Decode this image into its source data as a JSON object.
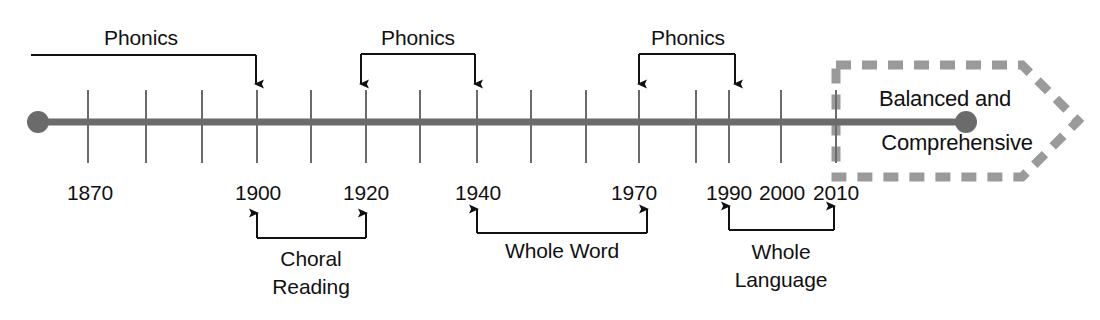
{
  "diagram": {
    "colors": {
      "axis": "#6b6b6b",
      "tick": "#6b6b6b",
      "ink": "#111111",
      "banner_dash": "#9a9a9a",
      "background": "#ffffff"
    },
    "axis": {
      "start_x": 36,
      "end_x": 967,
      "y": 122,
      "start_dot": true,
      "end_dot": true
    }
  },
  "chart_data": {
    "type": "timeline",
    "xlabel": "",
    "ylabel": "",
    "tick_years": [
      "1870",
      "1880",
      "1890",
      "1900",
      "1910",
      "1920",
      "1930",
      "1940",
      "1950",
      "1960",
      "1970",
      "1980",
      "1990",
      "2000",
      "2010"
    ],
    "labeled_years": [
      "1870",
      "1900",
      "1920",
      "1940",
      "1970",
      "1990",
      "2000",
      "2010"
    ],
    "spans_above": [
      {
        "label": "Phonics",
        "from": "start",
        "to": "1900"
      },
      {
        "label": "Phonics",
        "from": "1920",
        "to": "1940"
      },
      {
        "label": "Phonics",
        "from": "1970",
        "to": "1990"
      }
    ],
    "spans_below": [
      {
        "label": "Choral Reading",
        "from": "1900",
        "to": "1920"
      },
      {
        "label": "Whole Word",
        "from": "1940",
        "to": "1970"
      },
      {
        "label": "Whole Language",
        "from": "1990",
        "to": "2010"
      }
    ],
    "banner": {
      "label": "Balanced and Comprehensive",
      "from": "2010",
      "to": "future"
    }
  },
  "ticks": [
    {
      "year": "1870",
      "x": 88,
      "labeled": true
    },
    {
      "year": "1880",
      "x": 146,
      "labeled": false
    },
    {
      "year": "1890",
      "x": 202,
      "labeled": false
    },
    {
      "year": "1900",
      "x": 257,
      "labeled": true
    },
    {
      "year": "1910",
      "x": 311,
      "labeled": false
    },
    {
      "year": "1920",
      "x": 366,
      "labeled": true
    },
    {
      "year": "1930",
      "x": 420,
      "labeled": false
    },
    {
      "year": "1940",
      "x": 477,
      "labeled": true
    },
    {
      "year": "1950",
      "x": 531,
      "labeled": false
    },
    {
      "year": "1960",
      "x": 586,
      "labeled": false
    },
    {
      "year": "1970",
      "x": 639,
      "labeled": true
    },
    {
      "year": "1980",
      "x": 696,
      "labeled": false
    },
    {
      "year": "1990",
      "x": 729,
      "labeled": true
    },
    {
      "year": "2000",
      "x": 781,
      "labeled": true
    },
    {
      "year": "2010",
      "x": 836,
      "labeled": true
    }
  ],
  "year_labels": [
    {
      "text": "1870",
      "x": 90,
      "y": 182
    },
    {
      "text": "1900",
      "x": 258,
      "y": 182
    },
    {
      "text": "1920",
      "x": 366,
      "y": 182
    },
    {
      "text": "1940",
      "x": 478,
      "y": 182
    },
    {
      "text": "1970",
      "x": 634,
      "y": 182
    },
    {
      "text": "1990",
      "x": 729,
      "y": 182
    },
    {
      "text": "2000",
      "x": 782,
      "y": 182
    },
    {
      "text": "2010",
      "x": 836,
      "y": 182
    }
  ],
  "phonics_brackets": [
    {
      "label": "Phonics",
      "label_x": 141,
      "label_y": 27,
      "left_x": 31,
      "right_x": 256,
      "bar_y": 55,
      "arrow_y": 84,
      "left_arrow": false,
      "right_arrow": true
    },
    {
      "label": "Phonics",
      "label_x": 418,
      "label_y": 27,
      "left_x": 361,
      "right_x": 475,
      "bar_y": 54,
      "arrow_y": 84,
      "left_arrow": true,
      "right_arrow": true
    },
    {
      "label": "Phonics",
      "label_x": 688,
      "label_y": 27,
      "left_x": 639,
      "right_x": 735,
      "bar_y": 54,
      "arrow_y": 84,
      "left_arrow": true,
      "right_arrow": true
    }
  ],
  "lower_brackets": [
    {
      "lines": [
        "Choral",
        "Reading"
      ],
      "label_x": 311,
      "label_y": 245,
      "left_x": 257,
      "right_x": 366,
      "bar_y": 238,
      "arrow_y": 213
    },
    {
      "lines": [
        "Whole Word"
      ],
      "label_x": 562,
      "label_y": 240,
      "left_x": 477,
      "right_x": 647,
      "bar_y": 233,
      "arrow_y": 209
    },
    {
      "lines": [
        "Whole",
        "Language"
      ],
      "label_x": 781,
      "label_y": 238,
      "left_x": 729,
      "right_x": 834,
      "bar_y": 230,
      "arrow_y": 206
    }
  ],
  "banner": {
    "line_top": "Balanced and",
    "line_bottom": "Comprehensive",
    "top_x": 945,
    "top_y": 88,
    "bottom_x": 957,
    "bottom_y": 132
  }
}
